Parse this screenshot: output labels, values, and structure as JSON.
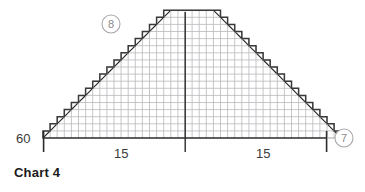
{
  "caption": "Chart 4",
  "colors": {
    "grid": "#b9b9bd",
    "outline": "#3a3a3a",
    "center_line": "#2b2b2b",
    "axis": "#2b2b2b",
    "tick_mark": "#2b2b2b",
    "label_text": "#3a3a3a",
    "marker_text": "#8a8a8a",
    "marker_ring": "#a9a9ad",
    "caption_text": "#1a1a1a",
    "background": "#ffffff"
  },
  "axis": {
    "left_label": "60",
    "bottom_labels": [
      "15",
      "15"
    ]
  },
  "markers": [
    {
      "name": "marker-8",
      "label": "8",
      "cx": 111,
      "cy": 24,
      "r": 9
    },
    {
      "name": "marker-7",
      "label": "7",
      "cx": 344,
      "cy": 138,
      "r": 9
    }
  ],
  "chart_data": {
    "type": "bar",
    "title": "Chart 4",
    "xlabel": "",
    "ylabel": "",
    "subtitle": "",
    "grid": true,
    "legend": "none",
    "symmetry": "mirrored about center spine",
    "cell_px": 7.1,
    "origin": {
      "x": 43,
      "y": 138
    },
    "columns": 42,
    "rows": 18,
    "xlim": [
      0,
      42
    ],
    "ylim": [
      0,
      18
    ],
    "categories": [
      "1",
      "2",
      "3",
      "4",
      "5",
      "6",
      "7",
      "8",
      "9",
      "10",
      "11",
      "12",
      "13",
      "14",
      "15",
      "16",
      "17",
      "18",
      "19",
      "20",
      "21",
      "22",
      "23",
      "24",
      "25",
      "26",
      "27",
      "28",
      "29",
      "30",
      "31",
      "32",
      "33",
      "34",
      "35",
      "36",
      "37",
      "38",
      "39",
      "40",
      "41",
      "42"
    ],
    "values": [
      1,
      2,
      3,
      4,
      5,
      6,
      7,
      8,
      9,
      10,
      11,
      12,
      13,
      14,
      15,
      16,
      17,
      18,
      18,
      18,
      18,
      18,
      18,
      18,
      18,
      17,
      16,
      15,
      14,
      13,
      12,
      11,
      10,
      9,
      8,
      7,
      6,
      5,
      4,
      3,
      2,
      1
    ],
    "decrease_marks_left": [
      1,
      2,
      3,
      4,
      5,
      6,
      7,
      8,
      9,
      10,
      11,
      12,
      13,
      14,
      15,
      16,
      17,
      18
    ],
    "decrease_marks_right": [
      25,
      26,
      27,
      28,
      29,
      30,
      31,
      32,
      33,
      34,
      35,
      36,
      37,
      38,
      39,
      40,
      41,
      42
    ],
    "annotations": [
      {
        "text": "60",
        "where": "left-of-baseline"
      },
      {
        "text": "15",
        "where": "below-axis-left"
      },
      {
        "text": "15",
        "where": "below-axis-right"
      },
      {
        "text": "8",
        "where": "upper-left-circle"
      },
      {
        "text": "7",
        "where": "right-baseline-circle"
      }
    ]
  }
}
